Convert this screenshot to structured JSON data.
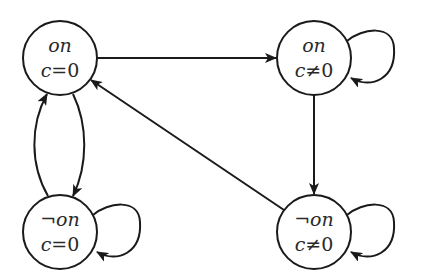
{
  "diagram": {
    "type": "state-machine",
    "colors": {
      "stroke": "#1a1a1a",
      "text": "#2a2a2a",
      "background": "#ffffff"
    },
    "nodes": [
      {
        "id": "s1",
        "line1": "on",
        "line1_neg": "",
        "line2_var": "c",
        "line2_rest": "=0",
        "cx": 60,
        "cy": 58
      },
      {
        "id": "s2",
        "line1": "on",
        "line1_neg": "",
        "line2_var": "c",
        "line2_rest": "≠0",
        "cx": 314,
        "cy": 58
      },
      {
        "id": "s3",
        "line1": "on",
        "line1_neg": "¬",
        "line2_var": "c",
        "line2_rest": "=0",
        "cx": 60,
        "cy": 232
      },
      {
        "id": "s4",
        "line1": "on",
        "line1_neg": "¬",
        "line2_var": "c",
        "line2_rest": "≠0",
        "cx": 314,
        "cy": 232
      }
    ],
    "edges": [
      {
        "from": "s1",
        "to": "s2",
        "label": ""
      },
      {
        "from": "s2",
        "to": "s2",
        "label": "",
        "self_loop": true
      },
      {
        "from": "s2",
        "to": "s4",
        "label": ""
      },
      {
        "from": "s4",
        "to": "s4",
        "label": "",
        "self_loop": true
      },
      {
        "from": "s4",
        "to": "s1",
        "label": ""
      },
      {
        "from": "s1",
        "to": "s3",
        "label": ""
      },
      {
        "from": "s3",
        "to": "s1",
        "label": ""
      },
      {
        "from": "s3",
        "to": "s3",
        "label": "",
        "self_loop": true
      }
    ]
  }
}
